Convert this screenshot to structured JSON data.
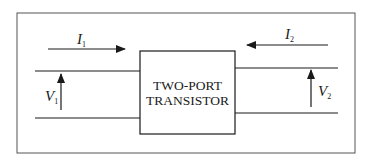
{
  "diagram": {
    "block": {
      "line1": "TWO-PORT",
      "line2": "TRANSISTOR"
    },
    "port1": {
      "current_label": "I",
      "current_subscript": "1",
      "current_direction": "into block (left-to-right)",
      "voltage_label": "V",
      "voltage_subscript": "1",
      "voltage_direction": "up"
    },
    "port2": {
      "current_label": "I",
      "current_subscript": "2",
      "current_direction": "into block (right-to-left)",
      "voltage_label": "V",
      "voltage_subscript": "2",
      "voltage_direction": "up"
    },
    "colors": {
      "stroke": "#1a1a1a",
      "frame": "#555555",
      "background": "#ffffff"
    }
  }
}
